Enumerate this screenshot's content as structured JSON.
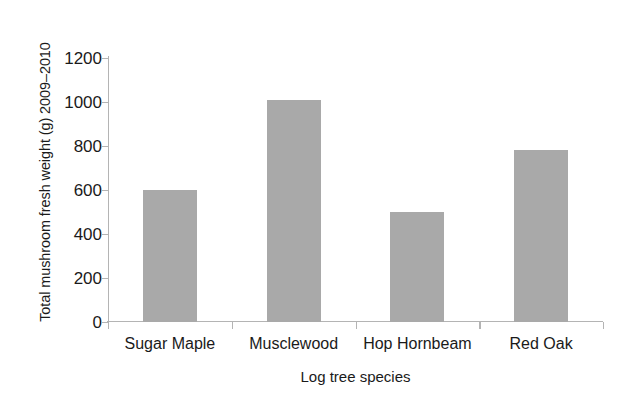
{
  "chart_data": {
    "type": "bar",
    "title": "",
    "categories": [
      "Sugar Maple",
      "Musclewood",
      "Hop Hornbeam",
      "Red Oak"
    ],
    "values": [
      600,
      1010,
      500,
      780
    ],
    "xlabel": "Log tree species",
    "ylabel": "Total mushroom fresh weight (g) 2009–2010",
    "ylim": [
      0,
      1200
    ],
    "ytick_values": [
      0,
      200,
      400,
      600,
      800,
      1000,
      1200
    ],
    "ytick_labels": [
      "0",
      "200",
      "400",
      "600",
      "800",
      "1000",
      "1200"
    ],
    "grid": false,
    "legend": null,
    "bar_color": "#a9a9a9",
    "axis_color": "#b4b4b4",
    "text_color": "#1a1a1a",
    "background": "#ffffff"
  }
}
